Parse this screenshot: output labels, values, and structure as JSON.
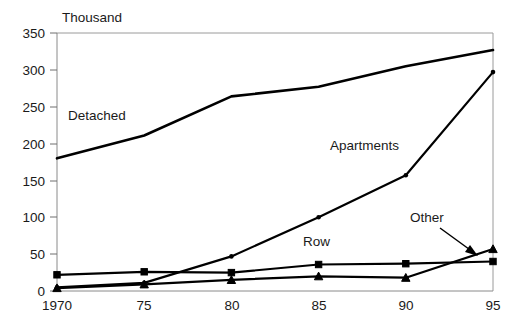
{
  "chart_data": {
    "type": "line",
    "title": "",
    "subtitle": "",
    "unit_label": "Thousand",
    "xlabel": "",
    "ylabel": "",
    "x": [
      1970,
      1975,
      1980,
      1985,
      1990,
      1995
    ],
    "categories": [
      "1970",
      "75",
      "80",
      "85",
      "90",
      "95"
    ],
    "xtick_labels": [
      "1970",
      "75",
      "80",
      "85",
      "90",
      "95"
    ],
    "ytick_labels": [
      "0",
      "50",
      "100",
      "150",
      "200",
      "250",
      "300",
      "350"
    ],
    "ylim": [
      0,
      350
    ],
    "ytick_step": 50,
    "grid": false,
    "legend_position": "inline-annotations",
    "series": [
      {
        "name": "Detached",
        "label": "Detached",
        "marker": "none",
        "values": [
          180,
          211,
          264,
          277,
          305,
          327
        ]
      },
      {
        "name": "Apartments",
        "label": "Apartments",
        "marker": "dot",
        "values": [
          5,
          11,
          47,
          100,
          157,
          297
        ]
      },
      {
        "name": "Row",
        "label": "Row",
        "marker": "square",
        "values": [
          22,
          26,
          25,
          36,
          37,
          40
        ]
      },
      {
        "name": "Other",
        "label": "Other",
        "marker": "triangle",
        "values": [
          4,
          9,
          15,
          20,
          18,
          57
        ]
      }
    ],
    "annotations": [
      {
        "text": "Detached",
        "series": "Detached"
      },
      {
        "text": "Apartments",
        "series": "Apartments"
      },
      {
        "text": "Row",
        "series": "Row"
      },
      {
        "text": "Other",
        "series": "Other",
        "arrow": true
      }
    ]
  },
  "axis": {
    "unit": "Thousand",
    "y_ticks": [
      "350",
      "300",
      "250",
      "200",
      "150",
      "100",
      "50",
      "0"
    ],
    "x_ticks": [
      "1970",
      "75",
      "80",
      "85",
      "90",
      "95"
    ]
  },
  "labels": {
    "detached": "Detached",
    "apartments": "Apartments",
    "row": "Row",
    "other": "Other"
  },
  "colors": {
    "line": "#000000",
    "axis": "#8a8a8a",
    "text": "#1a1a1a",
    "background": "#ffffff"
  }
}
